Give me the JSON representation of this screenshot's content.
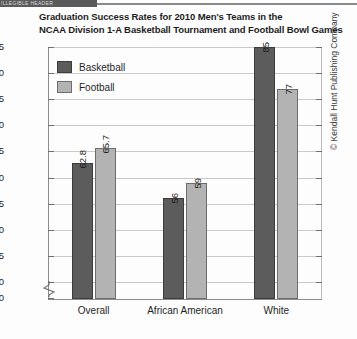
{
  "top_fragment": "ILLEGIBLE HEADER",
  "credit": "© Kendall Hunt Publishing Company",
  "chart_data": {
    "type": "bar",
    "title": "Graduation Success Rates for 2010 Men's Teams in the NCAA Division 1-A Basketball Tournament and Football Bowl Games",
    "title_lines": [
      "Graduation Success Rates for 2010 Men's Teams in the",
      "NCAA Division 1-A Basketball Tournament and Football Bowl Games"
    ],
    "categories": [
      "Overall",
      "African American",
      "White"
    ],
    "series": [
      {
        "name": "Basketball",
        "values": [
          62.8,
          56,
          85
        ],
        "labels": [
          "62.8",
          "56",
          "85"
        ],
        "color": "#5c5c5c"
      },
      {
        "name": "Football",
        "values": [
          65.7,
          59,
          77
        ],
        "labels": [
          "65.7",
          "59",
          "77"
        ],
        "color": "#b3b3b3"
      }
    ],
    "xlabel": "",
    "ylabel": "",
    "ylim": [
      40,
      85
    ],
    "y_axis_break": true,
    "yticks": [
      0,
      40,
      45,
      50,
      55,
      60,
      65,
      70,
      75,
      80,
      85
    ],
    "ytick_labels": [
      "0",
      "40",
      "45",
      "50",
      "55",
      "60",
      "65",
      "70",
      "75",
      "80",
      "85"
    ],
    "grid": true,
    "legend_position": "top-left"
  }
}
